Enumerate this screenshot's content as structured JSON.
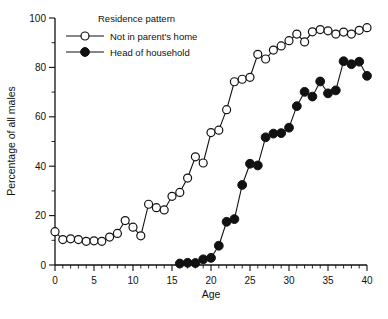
{
  "chart_data": {
    "type": "line",
    "title": "",
    "xlabel": "Age",
    "ylabel": "Percentage of all males",
    "xlim": [
      0,
      40
    ],
    "ylim": [
      0,
      100
    ],
    "xticks": [
      0,
      5,
      10,
      15,
      20,
      25,
      30,
      35,
      40
    ],
    "xtick_labels": [
      "0",
      "5",
      "10",
      "15",
      "20",
      "25",
      "30",
      "35",
      "40"
    ],
    "xtick_minor_step": 1,
    "yticks": [
      0,
      20,
      40,
      60,
      80,
      100
    ],
    "ytick_labels": [
      "0",
      "20",
      "40",
      "60",
      "80",
      "100"
    ],
    "ytick_minor_step": 10,
    "grid": false,
    "legend_title": "Residence pattern",
    "legend_position": "top-center-inside",
    "series": [
      {
        "name": "Not in parent's home",
        "marker": "open-circle",
        "x": [
          0,
          1,
          2,
          3,
          4,
          5,
          6,
          7,
          8,
          9,
          10,
          11,
          12,
          13,
          14,
          15,
          16,
          17,
          18,
          19,
          20,
          21,
          22,
          23,
          24,
          25,
          26,
          27,
          28,
          29,
          30,
          31,
          32,
          33,
          34,
          35,
          36,
          37,
          38,
          39,
          40
        ],
        "values": [
          13.5,
          10.3,
          10.6,
          10.3,
          9.6,
          9.8,
          9.6,
          11.3,
          12.8,
          18.0,
          15.3,
          11.8,
          24.6,
          23.2,
          22.3,
          27.8,
          29.4,
          35.2,
          43.8,
          41.3,
          53.6,
          54.6,
          62.9,
          74.2,
          75.2,
          76.0,
          85.3,
          83.4,
          87.0,
          88.7,
          90.8,
          93.5,
          90.3,
          94.4,
          95.3,
          94.8,
          93.5,
          94.3,
          93.5,
          95.0,
          96.1
        ]
      },
      {
        "name": "Head of household",
        "marker": "filled-circle",
        "x": [
          16,
          17,
          18,
          19,
          20,
          21,
          22,
          23,
          24,
          25,
          26,
          27,
          28,
          29,
          30,
          31,
          32,
          33,
          34,
          35,
          36,
          37,
          38,
          39,
          40
        ],
        "values": [
          0.6,
          0.9,
          0.8,
          2.3,
          2.9,
          7.8,
          17.5,
          18.6,
          32.4,
          41.0,
          40.3,
          51.7,
          53.2,
          53.4,
          55.6,
          64.3,
          70.1,
          68.2,
          74.3,
          69.5,
          70.7,
          82.5,
          81.3,
          82.3,
          76.6
        ]
      }
    ]
  }
}
